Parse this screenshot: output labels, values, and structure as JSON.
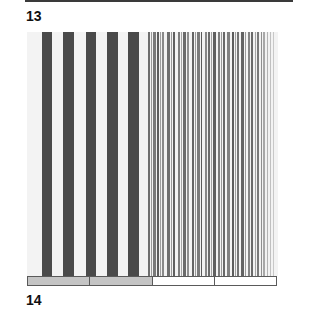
{
  "figure": {
    "top_label": "13",
    "bottom_label": "14"
  },
  "colors": {
    "panel_bg": "#f3f3f3",
    "wide_bar": "#4a4a4a",
    "legend_filled": "#c4c4c4",
    "legend_empty": "#ffffff"
  },
  "wide_bars": [
    {
      "x": 15,
      "w": 10
    },
    {
      "x": 36,
      "w": 11
    },
    {
      "x": 59,
      "w": 10
    },
    {
      "x": 80,
      "w": 11
    },
    {
      "x": 101,
      "w": 11
    }
  ],
  "fine_stripes": [
    {
      "x": 121,
      "w": 2,
      "c": "#6e6e6e"
    },
    {
      "x": 124,
      "w": 1,
      "c": "#9a9a9a"
    },
    {
      "x": 126,
      "w": 3,
      "c": "#7a7a7a"
    },
    {
      "x": 130,
      "w": 2,
      "c": "#5e5e5e"
    },
    {
      "x": 133,
      "w": 1,
      "c": "#a0a0a0"
    },
    {
      "x": 135,
      "w": 2,
      "c": "#8a8a8a"
    },
    {
      "x": 140,
      "w": 3,
      "c": "#707070"
    },
    {
      "x": 144,
      "w": 1,
      "c": "#9a9a9a"
    },
    {
      "x": 146,
      "w": 2,
      "c": "#606060"
    },
    {
      "x": 151,
      "w": 2,
      "c": "#7e7e7e"
    },
    {
      "x": 154,
      "w": 1,
      "c": "#a4a4a4"
    },
    {
      "x": 156,
      "w": 3,
      "c": "#6a6a6a"
    },
    {
      "x": 160,
      "w": 2,
      "c": "#8e8e8e"
    },
    {
      "x": 165,
      "w": 2,
      "c": "#646464"
    },
    {
      "x": 168,
      "w": 1,
      "c": "#9c9c9c"
    },
    {
      "x": 170,
      "w": 3,
      "c": "#7a7a7a"
    },
    {
      "x": 174,
      "w": 1,
      "c": "#5a5a5a"
    },
    {
      "x": 178,
      "w": 2,
      "c": "#888888"
    },
    {
      "x": 181,
      "w": 2,
      "c": "#6c6c6c"
    },
    {
      "x": 184,
      "w": 1,
      "c": "#a2a2a2"
    },
    {
      "x": 186,
      "w": 3,
      "c": "#606060"
    },
    {
      "x": 191,
      "w": 2,
      "c": "#7c7c7c"
    },
    {
      "x": 194,
      "w": 1,
      "c": "#989898"
    },
    {
      "x": 196,
      "w": 2,
      "c": "#686868"
    },
    {
      "x": 200,
      "w": 3,
      "c": "#808080"
    },
    {
      "x": 205,
      "w": 2,
      "c": "#5c5c5c"
    },
    {
      "x": 208,
      "w": 1,
      "c": "#a0a0a0"
    },
    {
      "x": 210,
      "w": 2,
      "c": "#747474"
    },
    {
      "x": 214,
      "w": 3,
      "c": "#626262"
    },
    {
      "x": 218,
      "w": 1,
      "c": "#9a9a9a"
    },
    {
      "x": 221,
      "w": 2,
      "c": "#848484"
    },
    {
      "x": 224,
      "w": 2,
      "c": "#6a6a6a"
    },
    {
      "x": 228,
      "w": 1,
      "c": "#a6a6a6"
    },
    {
      "x": 230,
      "w": 2,
      "c": "#7a7a7a"
    },
    {
      "x": 234,
      "w": 1,
      "c": "#909090"
    },
    {
      "x": 236,
      "w": 2,
      "c": "#a8a8a8"
    },
    {
      "x": 240,
      "w": 1,
      "c": "#b4b4b4"
    },
    {
      "x": 243,
      "w": 1,
      "c": "#c0c0c0"
    },
    {
      "x": 246,
      "w": 1,
      "c": "#c8c8c8"
    }
  ],
  "legend": [
    {
      "fill": "#c4c4c4"
    },
    {
      "fill": "#c4c4c4"
    },
    {
      "fill": "#ffffff"
    },
    {
      "fill": "#ffffff"
    }
  ]
}
